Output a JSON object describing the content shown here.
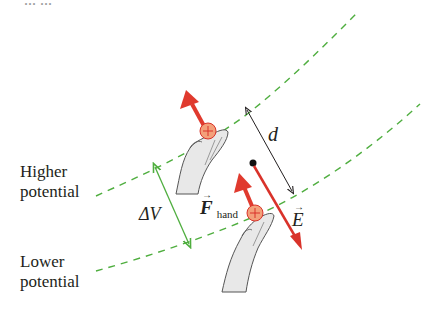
{
  "labels": {
    "higher_line1": "Higher",
    "higher_line2": "potential",
    "lower_line1": "Lower",
    "lower_line2": "potential",
    "delta_v": "ΔV",
    "distance": "d",
    "f_hand_main": "F",
    "f_hand_sub": "hand",
    "e_field": "E",
    "vector_arrow": "→",
    "charge_sign": "+",
    "top_cut_text": "... ..."
  },
  "colors": {
    "equipotential": "#4fae3f",
    "delta_v_arrow": "#4fae3f",
    "force_arrow": "#e03a2e",
    "e_field_arrow": "#d9322a",
    "charge_fill": "#f3a07a",
    "charge_stroke": "#d9322a",
    "text": "#231f20",
    "hand_fill": "#e8e8e8",
    "hand_stroke": "#555555"
  }
}
